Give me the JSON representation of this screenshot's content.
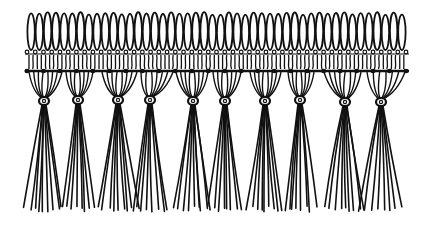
{
  "illustration": {
    "subject": "Macramé fringe with looped heading and knotted tassels",
    "background": "#ffffff",
    "ink": "#111111",
    "loops": {
      "count": 46,
      "x_start": 27,
      "x_end": 406,
      "top_y": 13,
      "bottom_y": 50
    },
    "band": {
      "top_y": 50,
      "bottom_y": 72,
      "left_x": 25,
      "right_x": 409,
      "dots_y": 52,
      "knot_row_y": 71
    },
    "tassels": [
      {
        "knot_x": 44,
        "knot_y": 101,
        "spread_left": 29,
        "spread_right": 62,
        "strands": 8
      },
      {
        "knot_x": 78,
        "knot_y": 100,
        "spread_left": 66,
        "spread_right": 93,
        "strands": 7
      },
      {
        "knot_x": 118,
        "knot_y": 100,
        "spread_left": 102,
        "spread_right": 137,
        "strands": 8
      },
      {
        "knot_x": 150,
        "knot_y": 100,
        "spread_left": 141,
        "spread_right": 173,
        "strands": 7
      },
      {
        "knot_x": 193,
        "knot_y": 101,
        "spread_left": 176,
        "spread_right": 208,
        "strands": 8
      },
      {
        "knot_x": 225,
        "knot_y": 101,
        "spread_left": 213,
        "spread_right": 241,
        "strands": 7
      },
      {
        "knot_x": 265,
        "knot_y": 101,
        "spread_left": 250,
        "spread_right": 281,
        "strands": 8
      },
      {
        "knot_x": 300,
        "knot_y": 100,
        "spread_left": 288,
        "spread_right": 314,
        "strands": 7
      },
      {
        "knot_x": 345,
        "knot_y": 102,
        "spread_left": 324,
        "spread_right": 361,
        "strands": 8
      },
      {
        "knot_x": 381,
        "knot_y": 102,
        "spread_left": 367,
        "spread_right": 405,
        "strands": 7
      }
    ],
    "strand_end_y": 212
  }
}
